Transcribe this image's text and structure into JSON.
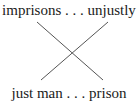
{
  "diagram": {
    "type": "chiasmus",
    "top": "imprisons . . . unjustly",
    "bottom": "just man . . . prison",
    "line_color": "#555555",
    "text_color": "#1a1a1a",
    "lines": [
      {
        "from": "imprisons",
        "to": "prison"
      },
      {
        "from": "unjustly",
        "to": "just man"
      }
    ]
  }
}
